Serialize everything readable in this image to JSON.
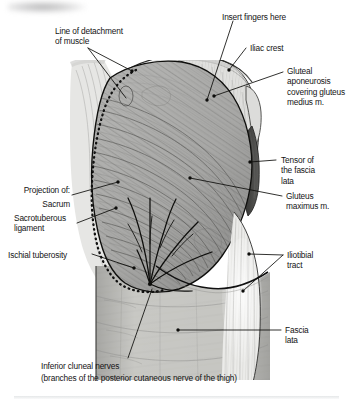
{
  "figure": {
    "type": "anatomical-illustration",
    "orientation": "posterior"
  },
  "labels": {
    "line_of_detachment": "Line of detachment\nof muscle",
    "insert_fingers": "Insert fingers here",
    "iliac_crest": "Iliac crest",
    "gluteal_aponeurosis": "Gluteal\naponeurosis\ncovering gluteus\nmedius m.",
    "tensor_fascia_lata": "Tensor of\nthe fascia\nlata",
    "gluteus_maximus": "Gluteus\nmaximus m.",
    "iliotibial_tract": "Iliotibial\ntract",
    "fascia_lata": "Fascia\nlata",
    "projection_of": "Projection of:",
    "sacrum": "Sacrum",
    "sacrotuberous_ligament": "Sacrotuberous\nligament",
    "ischial_tuberosity": "Ischial tuberosity",
    "inferior_cluneal_nerves_1": "Inferior cluneal nerves",
    "inferior_cluneal_nerves_2": "(branches of the posterior cutaneous nerve of the thigh)"
  },
  "colors": {
    "page_background": "#ffffff",
    "text": "#141414",
    "leader_line": "#101010",
    "muscle_fill": "#b8b8b6",
    "muscle_shadow": "#8d8d8b",
    "aponeurosis_fill": "#e2e2e0",
    "skin_fill": "#cfcfcb",
    "tensor_dark": "#4a4a48",
    "tract_light": "#f0f0ee",
    "outline": "#0d0d0d",
    "dotted_line": "#0a0a0a"
  }
}
